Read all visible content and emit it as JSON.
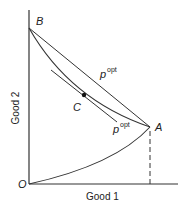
{
  "diagram": {
    "x_axis_label": "Good 1",
    "y_axis_label": "Good 2",
    "points": {
      "origin": "O",
      "B": "B",
      "A": "A",
      "C": "C"
    },
    "price_labels": {
      "upper": "p",
      "upper_sup": "opt",
      "lower": "p",
      "lower_sup": "opt"
    },
    "colors": {
      "line": "#333333",
      "background": "#ffffff"
    }
  }
}
